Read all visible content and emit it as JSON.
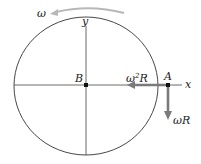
{
  "diagram": {
    "labels": {
      "omega": "ω",
      "y_axis": "y",
      "x_axis": "x",
      "point_b": "B",
      "point_a": "A",
      "centripetal": "ω",
      "centripetal_sup": "2",
      "centripetal_r": "R",
      "tangential": "ωR"
    },
    "colors": {
      "circle": "#333333",
      "axes": "#444444",
      "vector": "#7a7a7a",
      "rotation_arrow": "#b8b8b8",
      "point": "#111111"
    }
  }
}
